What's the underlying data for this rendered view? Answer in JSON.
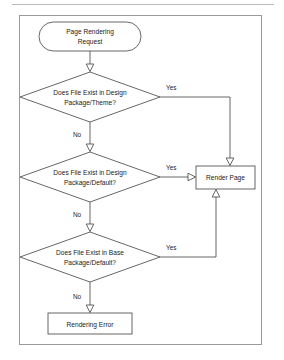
{
  "diagram": {
    "colors": {
      "stroke": "#404040",
      "fill": "#ffffff",
      "text": "#1a1a1a",
      "frame": "#9a9a9a",
      "rule": "#b9b9b9"
    },
    "nodes": {
      "start": {
        "shape": "stadium",
        "line1": "Page Rendering",
        "line2": "Request"
      },
      "decision1": {
        "shape": "diamond",
        "line1": "Does File Exist in Design",
        "line2": "Package/Theme?"
      },
      "decision2": {
        "shape": "diamond",
        "line1": "Does File Exist in Design",
        "line2": "Package/Default?"
      },
      "decision3": {
        "shape": "diamond",
        "line1": "Does File Exist in Base",
        "line2": "Package/Default?"
      },
      "render_page": {
        "shape": "rectangle",
        "label": "Render Page"
      },
      "rendering_error": {
        "shape": "rectangle",
        "label": "Rendering Error"
      }
    },
    "edge_labels": {
      "yes1": "Yes",
      "yes2": "Yes",
      "yes3": "Yes",
      "no1": "No",
      "no2": "No",
      "no3": "No"
    }
  }
}
